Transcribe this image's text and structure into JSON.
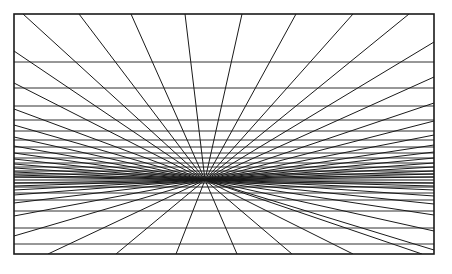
{
  "diagram": {
    "canvas": {
      "width": 452,
      "height": 274,
      "background": "#ffffff"
    },
    "frame": {
      "x1": 14,
      "y1": 14,
      "x2": 434,
      "y2": 254,
      "stroke": "#1a1a1a",
      "stroke_width": 1.6
    },
    "vanishing_point": {
      "x": 205,
      "y": 180
    },
    "line_color": "#1a1a1a",
    "horizontal_lines_y": [
      62,
      88,
      106,
      120,
      131,
      140,
      147,
      153,
      158,
      163,
      167,
      171,
      174,
      177,
      180,
      183,
      187,
      193,
      200,
      211,
      228,
      244
    ],
    "radial_targets": [
      [
        23,
        14
      ],
      [
        79,
        14
      ],
      [
        131,
        14
      ],
      [
        185,
        14
      ],
      [
        242,
        14
      ],
      [
        296,
        14
      ],
      [
        353,
        14
      ],
      [
        409,
        14
      ],
      [
        14,
        51
      ],
      [
        14,
        83
      ],
      [
        14,
        109
      ],
      [
        14,
        125
      ],
      [
        14,
        137
      ],
      [
        14,
        146
      ],
      [
        14,
        153
      ],
      [
        14,
        159
      ],
      [
        14,
        164
      ],
      [
        14,
        168
      ],
      [
        14,
        172
      ],
      [
        14,
        175
      ],
      [
        14,
        177
      ],
      [
        434,
        42
      ],
      [
        434,
        77
      ],
      [
        434,
        103
      ],
      [
        434,
        121
      ],
      [
        434,
        135
      ],
      [
        434,
        145
      ],
      [
        434,
        152
      ],
      [
        434,
        158
      ],
      [
        434,
        163
      ],
      [
        434,
        167
      ],
      [
        434,
        171
      ],
      [
        434,
        174
      ],
      [
        434,
        177
      ],
      [
        14,
        183
      ],
      [
        14,
        186
      ],
      [
        14,
        190
      ],
      [
        14,
        195
      ],
      [
        14,
        203
      ],
      [
        14,
        216
      ],
      [
        14,
        236
      ],
      [
        434,
        183
      ],
      [
        434,
        186
      ],
      [
        434,
        190
      ],
      [
        434,
        196
      ],
      [
        434,
        204
      ],
      [
        434,
        215
      ],
      [
        434,
        231
      ],
      [
        434,
        250
      ],
      [
        48,
        254
      ],
      [
        116,
        254
      ],
      [
        176,
        254
      ],
      [
        237,
        254
      ],
      [
        292,
        254
      ],
      [
        353,
        254
      ],
      [
        422,
        254
      ]
    ]
  }
}
